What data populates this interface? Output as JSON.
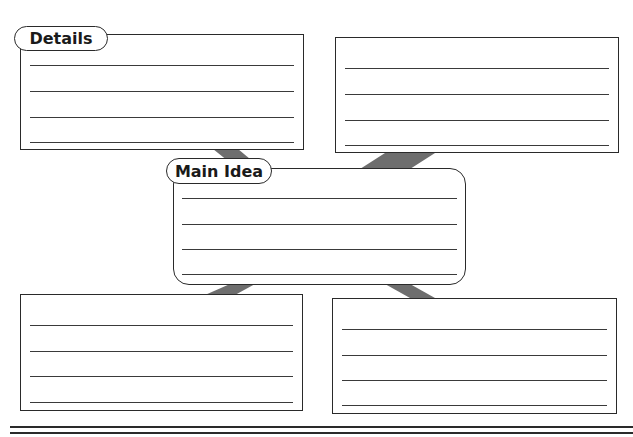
{
  "organizer": {
    "type": "main-idea-and-details",
    "labels": {
      "details": "Details",
      "main_idea": "Main Idea"
    },
    "boxes": [
      {
        "id": "top-left",
        "role": "details",
        "lines": 4,
        "has_label": true
      },
      {
        "id": "top-right",
        "role": "details",
        "lines": 4,
        "has_label": false
      },
      {
        "id": "center",
        "role": "main-idea",
        "lines": 4,
        "has_label": true
      },
      {
        "id": "bottom-left",
        "role": "details",
        "lines": 4,
        "has_label": false
      },
      {
        "id": "bottom-right",
        "role": "details",
        "lines": 4,
        "has_label": false
      }
    ],
    "colors": {
      "border": "#2a2a2a",
      "connector": "#6e6e6e",
      "background": "#ffffff"
    }
  }
}
